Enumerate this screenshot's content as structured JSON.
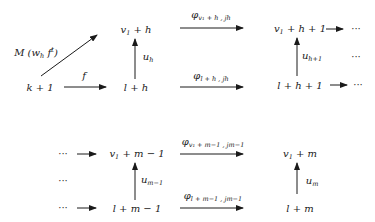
{
  "diagram": {
    "type": "commutative-diagram",
    "nodes": {
      "k1": {
        "text": "k + 1"
      },
      "v1h": {
        "main": "v",
        "sub": "1",
        "rest": " + h"
      },
      "lh": {
        "text": "l + h"
      },
      "v1h1": {
        "main": "v",
        "sub": "1",
        "rest": " + h + 1"
      },
      "lh1": {
        "text": "l + h + 1"
      },
      "v1m1": {
        "main": "v",
        "sub": "1",
        "rest": " + m − 1"
      },
      "lm1": {
        "text": "l + m − 1"
      },
      "v1m": {
        "main": "v",
        "sub": "1",
        "rest": " + m"
      },
      "lm": {
        "text": "l + m"
      }
    },
    "edges": {
      "diag": {
        "main": "M (w",
        "sub": "h",
        "rest": " f",
        "sup": "t",
        "close": ")"
      },
      "f": {
        "text": "f"
      },
      "uh": {
        "main": "u",
        "sub": "h"
      },
      "uh1": {
        "main": "u",
        "sub": "h+1"
      },
      "phi_top1": {
        "main": "φ",
        "sub": "v₁ + h , jh"
      },
      "phi_bot1": {
        "main": "φ",
        "sub": "l + h , jh"
      },
      "um1": {
        "main": "u",
        "sub": "m−1"
      },
      "um": {
        "main": "u",
        "sub": "m"
      },
      "phi_top2": {
        "main": "φ",
        "sub": "v₁ + m−1 , jm−1"
      },
      "phi_bot2": {
        "main": "φ",
        "sub": "l + m−1 , jm−1"
      }
    },
    "ellipsis": "···"
  }
}
